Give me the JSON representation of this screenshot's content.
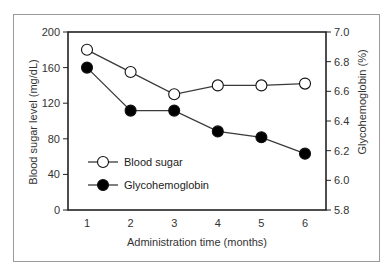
{
  "chart_data": {
    "type": "line",
    "title": "",
    "x": [
      1,
      2,
      3,
      4,
      5,
      6
    ],
    "xlabel": "Administration time (months)",
    "ylabel": "Blood sugar level (mg/dL)",
    "y2label": "Glycohemoglobin (%)",
    "ylim": [
      0,
      200
    ],
    "y2lim": [
      5.8,
      7.0
    ],
    "yticks": [
      0,
      40,
      80,
      120,
      160,
      200
    ],
    "y2ticks": [
      "5.8",
      "6.0",
      "6.2",
      "6.4",
      "6.6",
      "6.8",
      "7.0"
    ],
    "xticks": [
      "1",
      "2",
      "3",
      "4",
      "5",
      "6"
    ],
    "grid": false,
    "legend_position": "lower-left inside",
    "series": [
      {
        "name": "Blood sugar",
        "axis": "left",
        "marker": "open-circle",
        "values": [
          180,
          155,
          130,
          140,
          140,
          142
        ]
      },
      {
        "name": "Glycohemoglobin",
        "axis": "right",
        "marker": "filled-circle",
        "values": [
          6.76,
          6.47,
          6.47,
          6.33,
          6.29,
          6.18
        ]
      }
    ]
  },
  "legend": {
    "items": [
      {
        "label": "Blood sugar"
      },
      {
        "label": "Glycohemoglobin"
      }
    ]
  },
  "colors": {
    "line": "#3a3a3a",
    "marker_fill_open": "#ffffff",
    "marker_fill_filled": "#000000",
    "frame": "#9a9a9a"
  }
}
